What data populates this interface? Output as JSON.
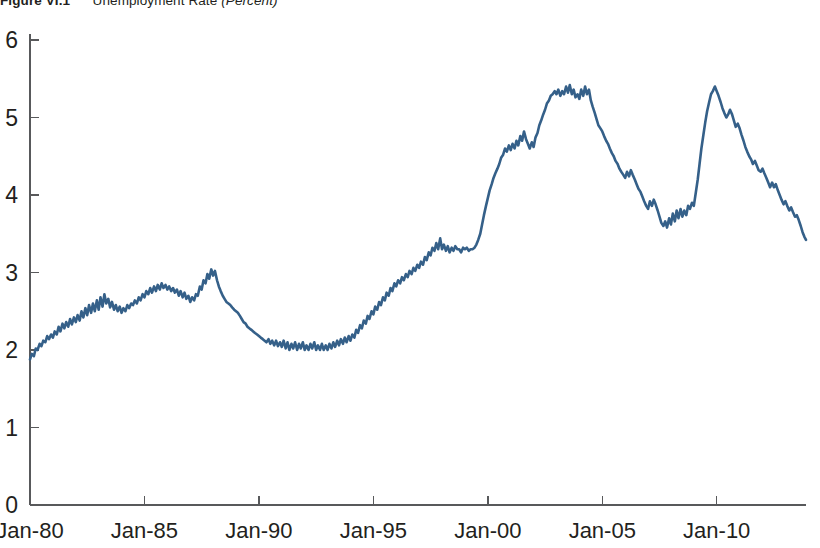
{
  "figure": {
    "number": "Figure VI.1",
    "caption_main": "Unemployment Rate",
    "caption_unit": "(Percent)"
  },
  "chart_data": {
    "type": "line",
    "title": "Unemployment Rate (Percent)",
    "xlabel": "",
    "ylabel": "",
    "ylim": [
      0,
      6
    ],
    "yticks": [
      0,
      1,
      2,
      3,
      4,
      5,
      6
    ],
    "ytick_labels": [
      "0",
      "1",
      "2",
      "3",
      "4",
      "5",
      "6"
    ],
    "xlim": [
      "Jan-80",
      "Dec-2013"
    ],
    "xticks": [
      "Jan-80",
      "Jan-85",
      "Jan-90",
      "Jan-95",
      "Jan-00",
      "Jan-05",
      "Jan-10"
    ],
    "xtick_labels": [
      "Jan-80",
      "Jan-85",
      "Jan-90",
      "Jan-95",
      "Jan-00",
      "Jan-05",
      "Jan-10"
    ],
    "grid": false,
    "legend": false,
    "line_color": "#356089",
    "axis_color": "#58595b",
    "x_start_year": 1980.0,
    "x_end_year": 2013.9,
    "series": [
      {
        "name": "Unemployment rate",
        "color": "#356089",
        "x": [
          1980.0,
          1980.08,
          1980.17,
          1980.25,
          1980.33,
          1980.42,
          1980.5,
          1980.58,
          1980.67,
          1980.75,
          1980.83,
          1980.92,
          1981.0,
          1981.08,
          1981.17,
          1981.25,
          1981.33,
          1981.42,
          1981.5,
          1981.58,
          1981.67,
          1981.75,
          1981.83,
          1981.92,
          1982.0,
          1982.08,
          1982.17,
          1982.25,
          1982.33,
          1982.42,
          1982.5,
          1982.58,
          1982.67,
          1982.75,
          1982.83,
          1982.92,
          1983.0,
          1983.08,
          1983.17,
          1983.25,
          1983.33,
          1983.42,
          1983.5,
          1983.58,
          1983.67,
          1983.75,
          1983.83,
          1983.92,
          1984.0,
          1984.08,
          1984.17,
          1984.25,
          1984.33,
          1984.42,
          1984.5,
          1984.58,
          1984.67,
          1984.75,
          1984.83,
          1984.92,
          1985.0,
          1985.08,
          1985.17,
          1985.25,
          1985.33,
          1985.42,
          1985.5,
          1985.58,
          1985.67,
          1985.75,
          1985.83,
          1985.92,
          1986.0,
          1986.08,
          1986.17,
          1986.25,
          1986.33,
          1986.42,
          1986.5,
          1986.58,
          1986.67,
          1986.75,
          1986.83,
          1986.92,
          1987.0,
          1987.08,
          1987.17,
          1987.25,
          1987.33,
          1987.42,
          1987.5,
          1987.58,
          1987.67,
          1987.75,
          1987.83,
          1987.92,
          1988.0,
          1988.08,
          1988.17,
          1988.25,
          1988.33,
          1988.42,
          1988.5,
          1988.58,
          1988.67,
          1988.75,
          1988.83,
          1988.92,
          1989.0,
          1989.08,
          1989.17,
          1989.25,
          1989.33,
          1989.42,
          1989.5,
          1989.58,
          1989.67,
          1989.75,
          1989.83,
          1989.92,
          1990.0,
          1990.08,
          1990.17,
          1990.25,
          1990.33,
          1990.42,
          1990.5,
          1990.58,
          1990.67,
          1990.75,
          1990.83,
          1990.92,
          1991.0,
          1991.08,
          1991.17,
          1991.25,
          1991.33,
          1991.42,
          1991.5,
          1991.58,
          1991.67,
          1991.75,
          1991.83,
          1991.92,
          1992.0,
          1992.08,
          1992.17,
          1992.25,
          1992.33,
          1992.42,
          1992.5,
          1992.58,
          1992.67,
          1992.75,
          1992.83,
          1992.92,
          1993.0,
          1993.08,
          1993.17,
          1993.25,
          1993.33,
          1993.42,
          1993.5,
          1993.58,
          1993.67,
          1993.75,
          1993.83,
          1993.92,
          1994.0,
          1994.08,
          1994.17,
          1994.25,
          1994.33,
          1994.42,
          1994.5,
          1994.58,
          1994.67,
          1994.75,
          1994.83,
          1994.92,
          1995.0,
          1995.08,
          1995.17,
          1995.25,
          1995.33,
          1995.42,
          1995.5,
          1995.58,
          1995.67,
          1995.75,
          1995.83,
          1995.92,
          1996.0,
          1996.08,
          1996.17,
          1996.25,
          1996.33,
          1996.42,
          1996.5,
          1996.58,
          1996.67,
          1996.75,
          1996.83,
          1996.92,
          1997.0,
          1997.08,
          1997.17,
          1997.25,
          1997.33,
          1997.42,
          1997.5,
          1997.58,
          1997.67,
          1997.75,
          1997.83,
          1997.92,
          1998.0,
          1998.08,
          1998.17,
          1998.25,
          1998.33,
          1998.42,
          1998.5,
          1998.58,
          1998.67,
          1998.75,
          1998.83,
          1998.92,
          1999.0,
          1999.08,
          1999.17,
          1999.25,
          1999.33,
          1999.42,
          1999.5,
          1999.58,
          1999.67,
          1999.75,
          1999.83,
          1999.92,
          2000.0,
          2000.08,
          2000.17,
          2000.25,
          2000.33,
          2000.42,
          2000.5,
          2000.58,
          2000.67,
          2000.75,
          2000.83,
          2000.92,
          2001.0,
          2001.08,
          2001.17,
          2001.25,
          2001.33,
          2001.42,
          2001.5,
          2001.58,
          2001.67,
          2001.75,
          2001.83,
          2001.92,
          2002.0,
          2002.08,
          2002.17,
          2002.25,
          2002.33,
          2002.42,
          2002.5,
          2002.58,
          2002.67,
          2002.75,
          2002.83,
          2002.92,
          2003.0,
          2003.08,
          2003.17,
          2003.25,
          2003.33,
          2003.42,
          2003.5,
          2003.58,
          2003.67,
          2003.75,
          2003.83,
          2003.92,
          2004.0,
          2004.08,
          2004.17,
          2004.25,
          2004.33,
          2004.42,
          2004.5,
          2004.58,
          2004.67,
          2004.75,
          2004.83,
          2004.92,
          2005.0,
          2005.08,
          2005.17,
          2005.25,
          2005.33,
          2005.42,
          2005.5,
          2005.58,
          2005.67,
          2005.75,
          2005.83,
          2005.92,
          2006.0,
          2006.08,
          2006.17,
          2006.25,
          2006.33,
          2006.42,
          2006.5,
          2006.58,
          2006.67,
          2006.75,
          2006.83,
          2006.92,
          2007.0,
          2007.08,
          2007.17,
          2007.25,
          2007.33,
          2007.42,
          2007.5,
          2007.58,
          2007.67,
          2007.75,
          2007.83,
          2007.92,
          2008.0,
          2008.08,
          2008.17,
          2008.25,
          2008.33,
          2008.42,
          2008.5,
          2008.58,
          2008.67,
          2008.75,
          2008.83,
          2008.92,
          2009.0,
          2009.08,
          2009.17,
          2009.25,
          2009.33,
          2009.42,
          2009.5,
          2009.58,
          2009.67,
          2009.75,
          2009.83,
          2009.92,
          2010.0,
          2010.08,
          2010.17,
          2010.25,
          2010.33,
          2010.42,
          2010.5,
          2010.58,
          2010.67,
          2010.75,
          2010.83,
          2010.92,
          2011.0,
          2011.08,
          2011.17,
          2011.25,
          2011.33,
          2011.42,
          2011.5,
          2011.58,
          2011.67,
          2011.75,
          2011.83,
          2011.92,
          2012.0,
          2012.08,
          2012.17,
          2012.25,
          2012.33,
          2012.42,
          2012.5,
          2012.58,
          2012.67,
          2012.75,
          2012.83,
          2012.92,
          2013.0,
          2013.08,
          2013.17,
          2013.25,
          2013.33,
          2013.42,
          2013.5,
          2013.58,
          2013.67,
          2013.75,
          2013.83,
          2013.9
        ],
        "y": [
          1.88,
          1.95,
          1.92,
          2.02,
          2.0,
          2.08,
          2.05,
          2.12,
          2.1,
          2.18,
          2.14,
          2.2,
          2.16,
          2.24,
          2.2,
          2.3,
          2.24,
          2.34,
          2.28,
          2.36,
          2.3,
          2.4,
          2.33,
          2.42,
          2.36,
          2.45,
          2.38,
          2.5,
          2.42,
          2.54,
          2.45,
          2.58,
          2.48,
          2.6,
          2.5,
          2.64,
          2.52,
          2.68,
          2.56,
          2.72,
          2.6,
          2.66,
          2.55,
          2.62,
          2.52,
          2.58,
          2.5,
          2.56,
          2.48,
          2.54,
          2.5,
          2.58,
          2.54,
          2.6,
          2.58,
          2.64,
          2.6,
          2.68,
          2.64,
          2.72,
          2.68,
          2.76,
          2.72,
          2.8,
          2.74,
          2.82,
          2.76,
          2.84,
          2.78,
          2.86,
          2.8,
          2.84,
          2.78,
          2.82,
          2.76,
          2.8,
          2.74,
          2.78,
          2.7,
          2.76,
          2.68,
          2.74,
          2.66,
          2.7,
          2.62,
          2.68,
          2.64,
          2.72,
          2.7,
          2.82,
          2.78,
          2.9,
          2.86,
          2.98,
          2.92,
          3.04,
          2.96,
          3.02,
          2.9,
          2.82,
          2.76,
          2.7,
          2.66,
          2.62,
          2.6,
          2.58,
          2.55,
          2.52,
          2.5,
          2.48,
          2.44,
          2.4,
          2.36,
          2.34,
          2.3,
          2.28,
          2.26,
          2.24,
          2.22,
          2.2,
          2.18,
          2.16,
          2.14,
          2.12,
          2.1,
          2.14,
          2.08,
          2.12,
          2.06,
          2.12,
          2.05,
          2.1,
          2.04,
          2.12,
          2.02,
          2.1,
          2.0,
          2.08,
          2.02,
          2.1,
          2.0,
          2.08,
          2.02,
          2.1,
          2.0,
          2.06,
          2.0,
          2.08,
          2.02,
          2.1,
          2.0,
          2.06,
          2.0,
          2.08,
          2.0,
          2.06,
          2.0,
          2.08,
          2.02,
          2.1,
          2.04,
          2.12,
          2.06,
          2.14,
          2.08,
          2.16,
          2.1,
          2.18,
          2.12,
          2.2,
          2.16,
          2.26,
          2.22,
          2.32,
          2.28,
          2.38,
          2.34,
          2.44,
          2.4,
          2.5,
          2.46,
          2.56,
          2.52,
          2.62,
          2.58,
          2.68,
          2.64,
          2.74,
          2.7,
          2.8,
          2.76,
          2.86,
          2.82,
          2.9,
          2.86,
          2.94,
          2.9,
          2.98,
          2.94,
          3.02,
          2.98,
          3.06,
          3.02,
          3.1,
          3.06,
          3.14,
          3.1,
          3.2,
          3.16,
          3.26,
          3.22,
          3.32,
          3.28,
          3.38,
          3.3,
          3.44,
          3.3,
          3.36,
          3.28,
          3.34,
          3.26,
          3.32,
          3.28,
          3.34,
          3.3,
          3.3,
          3.26,
          3.32,
          3.3,
          3.32,
          3.28,
          3.3,
          3.3,
          3.32,
          3.36,
          3.42,
          3.5,
          3.62,
          3.74,
          3.86,
          3.96,
          4.06,
          4.14,
          4.22,
          4.28,
          4.34,
          4.4,
          4.48,
          4.52,
          4.6,
          4.56,
          4.64,
          4.58,
          4.66,
          4.6,
          4.7,
          4.64,
          4.76,
          4.7,
          4.82,
          4.72,
          4.66,
          4.6,
          4.68,
          4.62,
          4.74,
          4.8,
          4.9,
          4.96,
          5.04,
          5.1,
          5.18,
          5.22,
          5.28,
          5.3,
          5.34,
          5.3,
          5.36,
          5.28,
          5.34,
          5.3,
          5.4,
          5.32,
          5.42,
          5.3,
          5.36,
          5.26,
          5.3,
          5.24,
          5.36,
          5.28,
          5.4,
          5.3,
          5.36,
          5.22,
          5.14,
          5.06,
          4.98,
          4.9,
          4.86,
          4.82,
          4.76,
          4.7,
          4.66,
          4.6,
          4.54,
          4.5,
          4.44,
          4.4,
          4.34,
          4.3,
          4.26,
          4.22,
          4.3,
          4.24,
          4.32,
          4.26,
          4.2,
          4.14,
          4.08,
          4.04,
          3.98,
          3.92,
          3.86,
          3.82,
          3.92,
          3.86,
          3.94,
          3.88,
          3.8,
          3.72,
          3.64,
          3.6,
          3.66,
          3.58,
          3.7,
          3.62,
          3.76,
          3.66,
          3.8,
          3.7,
          3.82,
          3.72,
          3.8,
          3.74,
          3.86,
          3.82,
          3.9,
          3.86,
          4.02,
          4.2,
          4.4,
          4.6,
          4.78,
          4.94,
          5.08,
          5.2,
          5.3,
          5.34,
          5.4,
          5.34,
          5.28,
          5.2,
          5.12,
          5.06,
          5.0,
          5.04,
          5.1,
          5.04,
          4.96,
          4.88,
          4.92,
          4.86,
          4.78,
          4.7,
          4.62,
          4.56,
          4.5,
          4.46,
          4.4,
          4.44,
          4.38,
          4.32,
          4.3,
          4.34,
          4.28,
          4.22,
          4.16,
          4.1,
          4.16,
          4.1,
          4.14,
          4.06,
          4.0,
          3.94,
          3.88,
          3.92,
          3.86,
          3.8,
          3.84,
          3.78,
          3.72,
          3.74,
          3.68,
          3.6,
          3.52,
          3.46,
          3.42
        ]
      }
    ]
  }
}
